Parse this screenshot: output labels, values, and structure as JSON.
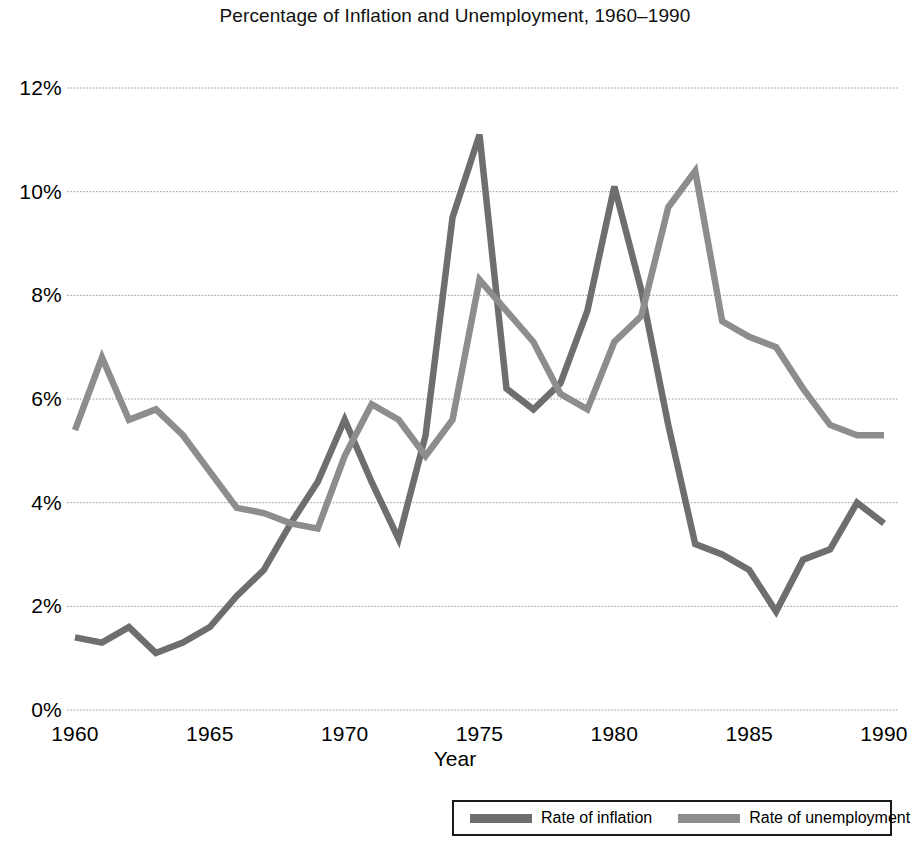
{
  "chart_data": {
    "type": "line",
    "title": "Percentage of Inflation and Unemployment, 1960–1990",
    "xlabel": "Year",
    "ylabel": "",
    "xlim": [
      1960,
      1990
    ],
    "ylim": [
      0,
      12
    ],
    "grid": true,
    "legend_position": "bottom-right",
    "x": [
      1960,
      1961,
      1962,
      1963,
      1964,
      1965,
      1966,
      1967,
      1968,
      1969,
      1970,
      1971,
      1972,
      1973,
      1974,
      1975,
      1976,
      1977,
      1978,
      1979,
      1980,
      1981,
      1982,
      1983,
      1984,
      1985,
      1986,
      1987,
      1988,
      1989,
      1990
    ],
    "x_tick_labels": [
      "1960",
      "1965",
      "1970",
      "1975",
      "1980",
      "1985",
      "1990"
    ],
    "x_tick_values": [
      1960,
      1965,
      1970,
      1975,
      1980,
      1985,
      1990
    ],
    "y_tick_labels": [
      "0%",
      "2%",
      "4%",
      "6%",
      "8%",
      "10%",
      "12%"
    ],
    "y_tick_values": [
      0,
      2,
      4,
      6,
      8,
      10,
      12
    ],
    "series": [
      {
        "name": "Rate of inflation",
        "color": "#6e6e6e",
        "values": [
          1.4,
          1.3,
          1.6,
          1.1,
          1.3,
          1.6,
          2.2,
          2.7,
          3.6,
          4.4,
          5.6,
          4.4,
          3.3,
          5.3,
          9.5,
          11.1,
          6.2,
          5.8,
          6.3,
          7.7,
          10.1,
          8.1,
          5.5,
          3.2,
          3.0,
          2.7,
          1.9,
          2.9,
          3.1,
          4.0,
          3.6
        ]
      },
      {
        "name": "Rate of unemployment",
        "color": "#8d8d8d",
        "values": [
          5.4,
          6.8,
          5.6,
          5.8,
          5.3,
          4.6,
          3.9,
          3.8,
          3.6,
          3.5,
          4.9,
          5.9,
          5.6,
          4.9,
          5.6,
          8.3,
          7.7,
          7.1,
          6.1,
          5.8,
          7.1,
          7.6,
          9.7,
          10.4,
          7.5,
          7.2,
          7.0,
          6.2,
          5.5,
          5.3,
          5.3
        ]
      }
    ]
  },
  "legend": {
    "entries": [
      {
        "label": "Rate of inflation",
        "color": "#6e6e6e"
      },
      {
        "label": "Rate of unemployment",
        "color": "#8d8d8d"
      }
    ]
  },
  "colors": {
    "inflation": "#6e6e6e",
    "unemployment": "#8d8d8d",
    "gridline": "#9a9a9a",
    "text": "#000000",
    "background": "#ffffff"
  }
}
